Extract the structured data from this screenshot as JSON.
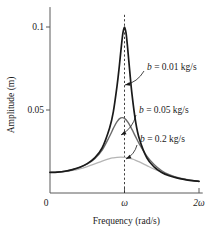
{
  "chart_data": {
    "type": "line",
    "title": "",
    "xlabel": "Frequency (rad/s)",
    "ylabel": "Amplitude (m)",
    "x_tick_labels": [
      "0",
      "ω",
      "2ω"
    ],
    "x_tick_values": [
      0,
      1,
      2
    ],
    "y_tick_labels": [
      "0.05",
      "0.1"
    ],
    "y_tick_values": [
      0.05,
      0.1
    ],
    "xlim": [
      0,
      2.05
    ],
    "ylim": [
      0,
      0.112
    ],
    "grid": false,
    "legend_position": "inline-annotations",
    "resonance_marker": {
      "x": 1,
      "style": "dashed-vertical",
      "label": "ω"
    },
    "series": [
      {
        "name": "b = 0.01 kg/s",
        "damping": 0.01,
        "color": "#1a1a1a",
        "width": 1.7,
        "peak_x": 1.0,
        "peak_y": 0.1,
        "x": [
          0.0,
          0.1,
          0.2,
          0.3,
          0.4,
          0.5,
          0.6,
          0.7,
          0.8,
          0.85,
          0.9,
          0.93,
          0.96,
          0.98,
          1.0,
          1.02,
          1.04,
          1.07,
          1.1,
          1.15,
          1.2,
          1.3,
          1.4,
          1.5,
          1.6,
          1.7,
          1.8,
          1.9,
          2.0
        ],
        "y": [
          0.0124,
          0.0126,
          0.0131,
          0.0141,
          0.0155,
          0.0177,
          0.0212,
          0.0272,
          0.0392,
          0.0489,
          0.0645,
          0.0762,
          0.0894,
          0.0968,
          0.1,
          0.0966,
          0.0884,
          0.0736,
          0.0597,
          0.0427,
          0.0325,
          0.0211,
          0.0156,
          0.0124,
          0.0104,
          0.0091,
          0.0082,
          0.0075,
          0.007
        ]
      },
      {
        "name": "b = 0.05 kg/s",
        "damping": 0.05,
        "color": "#6b6b6b",
        "width": 1.4,
        "peak_x": 1.0,
        "peak_y": 0.045,
        "x": [
          0.0,
          0.1,
          0.2,
          0.3,
          0.4,
          0.5,
          0.6,
          0.7,
          0.8,
          0.85,
          0.9,
          0.95,
          1.0,
          1.05,
          1.1,
          1.15,
          1.2,
          1.3,
          1.4,
          1.5,
          1.6,
          1.7,
          1.8,
          1.9,
          2.0
        ],
        "y": [
          0.0124,
          0.0126,
          0.0131,
          0.014,
          0.0154,
          0.0175,
          0.0207,
          0.0259,
          0.0342,
          0.0389,
          0.043,
          0.0452,
          0.045,
          0.0424,
          0.0383,
          0.0338,
          0.0295,
          0.0222,
          0.017,
          0.0134,
          0.011,
          0.0094,
          0.0083,
          0.0076,
          0.007
        ]
      },
      {
        "name": "b = 0.2 kg/s",
        "damping": 0.2,
        "color": "#b5b5b5",
        "width": 1.3,
        "peak_x": 1.0,
        "peak_y": 0.0215,
        "x": [
          0.0,
          0.1,
          0.2,
          0.3,
          0.4,
          0.5,
          0.6,
          0.7,
          0.8,
          0.85,
          0.9,
          0.95,
          1.0,
          1.05,
          1.1,
          1.15,
          1.2,
          1.3,
          1.4,
          1.5,
          1.6,
          1.7,
          1.8,
          1.9,
          2.0
        ],
        "y": [
          0.0124,
          0.0125,
          0.0129,
          0.0136,
          0.0146,
          0.0159,
          0.0175,
          0.0192,
          0.0207,
          0.0212,
          0.0215,
          0.0216,
          0.0215,
          0.0211,
          0.0205,
          0.0197,
          0.0187,
          0.0165,
          0.0143,
          0.0124,
          0.0108,
          0.0095,
          0.0085,
          0.0077,
          0.007
        ]
      }
    ],
    "annotations": [
      {
        "text": "b = 0.01 kg/s",
        "text_x": 147,
        "text_y": 70,
        "leader_from_x": 144,
        "leader_from_y": 71,
        "leader_to_x": 125,
        "leader_to_y": 85,
        "target_series": "b = 0.01 kg/s"
      },
      {
        "text": "b = 0.05 kg/s",
        "text_x": 139,
        "text_y": 113,
        "leader_from_x": 136,
        "leader_from_y": 115,
        "leader_to_x": 121,
        "leader_to_y": 135,
        "target_series": "b = 0.05 kg/s"
      },
      {
        "text": "b = 0.2 kg/s",
        "text_x": 140,
        "text_y": 142,
        "leader_from_x": 137,
        "leader_from_y": 145,
        "leader_to_x": 126,
        "leader_to_y": 159,
        "target_series": "b = 0.2 kg/s"
      }
    ]
  },
  "axes": {
    "origin_label": "0",
    "x_axis_title": "Frequency (rad/s)",
    "y_axis_title": "Amplitude (m)"
  }
}
